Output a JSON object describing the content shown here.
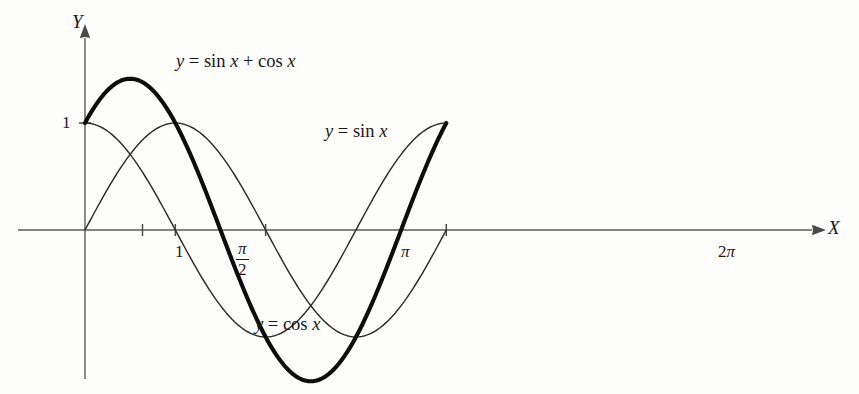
{
  "figure": {
    "background_color": "#fdfdfc",
    "axis_color": "#4a4a4a",
    "curve_color": "#2b2b2b",
    "bold_curve_color": "#0d0d0d"
  },
  "axes": {
    "x_axis_label": "X",
    "y_axis_label": "Y",
    "x_tick_labels": [
      "1",
      "π/2",
      "π",
      "2π"
    ],
    "y_tick_labels": [
      "1"
    ],
    "pi_over_two_numerator": "π",
    "pi_over_two_denominator": "2",
    "pi_label": "π",
    "two_pi_label": "2π",
    "one_label": "1"
  },
  "labels": {
    "sum_curve": "y = sin x + cos x",
    "sum_curve_parts": {
      "y": "y",
      "eq": "=",
      "sin": "sin",
      "x1": "x",
      "plus": "+",
      "cos": "cos",
      "x2": "x"
    },
    "sin_curve": "y = sin x",
    "cos_curve": "y = cos x"
  },
  "chart_data": {
    "type": "line",
    "title": "",
    "subtitle": "",
    "xlabel": "X",
    "ylabel": "Y",
    "xlim": [
      -0.62,
      6.96
    ],
    "ylim": [
      -1.6,
      1.78
    ],
    "grid": false,
    "legend": "inline-annotations",
    "x_ticks": [
      {
        "value": 1,
        "label": "1"
      },
      {
        "value": 1.5708,
        "label": "π/2"
      },
      {
        "value": 3.14159,
        "label": "π"
      },
      {
        "value": 6.28319,
        "label": "2π"
      }
    ],
    "y_ticks": [
      {
        "value": 1,
        "label": "1"
      }
    ],
    "x_domain": [
      0,
      6.28319
    ],
    "samples": 121,
    "series": [
      {
        "name": "y = sin x",
        "formula": "sin",
        "amplitude": 1,
        "phase": 0,
        "style": "thin",
        "stroke_width": 1.45,
        "color": "#2b2b2b",
        "key_points": [
          {
            "x": 0,
            "y": 0
          },
          {
            "x": 1.5708,
            "y": 1
          },
          {
            "x": 3.14159,
            "y": 0
          },
          {
            "x": 4.71239,
            "y": -1
          },
          {
            "x": 6.28319,
            "y": 0
          }
        ]
      },
      {
        "name": "y = cos x",
        "formula": "cos",
        "amplitude": 1,
        "phase": 1.5708,
        "style": "thin",
        "stroke_width": 1.45,
        "color": "#2b2b2b",
        "key_points": [
          {
            "x": 0,
            "y": 1
          },
          {
            "x": 1.5708,
            "y": 0
          },
          {
            "x": 3.14159,
            "y": -1
          },
          {
            "x": 4.71239,
            "y": 0
          },
          {
            "x": 6.28319,
            "y": 1
          }
        ]
      },
      {
        "name": "y = sin x + cos x",
        "formula": "sin+cos",
        "amplitude": 1.41421,
        "phase": 0.7854,
        "style": "bold",
        "stroke_width": 4.1,
        "color": "#0d0d0d",
        "key_points": [
          {
            "x": 0,
            "y": 1
          },
          {
            "x": 0.7854,
            "y": 1.41421
          },
          {
            "x": 2.35619,
            "y": 0
          },
          {
            "x": 3.92699,
            "y": -1.41421
          },
          {
            "x": 5.49779,
            "y": 0
          },
          {
            "x": 6.28319,
            "y": 1
          }
        ]
      }
    ]
  },
  "geometry": {
    "origin_px": {
      "x": 85,
      "y": 230
    },
    "unit_x_px": 57.5,
    "unit_y_px": 107,
    "x_axis_start_px": 18,
    "x_axis_end_px": 812,
    "y_axis_top_px": 38,
    "y_axis_bottom_px": 379,
    "tick_half_len_px": 6
  },
  "label_positions": {
    "y_axis_name": {
      "left": 72,
      "top": 12
    },
    "x_axis_name": {
      "left": 828,
      "top": 218
    },
    "one_y": {
      "left": 62,
      "top": 114
    },
    "tick_1": {
      "left": 175,
      "top": 243
    },
    "tick_pi_over_2": {
      "left": 236,
      "top": 240
    },
    "tick_pi": {
      "left": 401,
      "top": 243
    },
    "tick_2pi": {
      "left": 718,
      "top": 243
    },
    "sum_label": {
      "left": 176,
      "top": 52
    },
    "sin_label": {
      "left": 325,
      "top": 122
    },
    "cos_label": {
      "left": 255,
      "top": 315
    }
  }
}
